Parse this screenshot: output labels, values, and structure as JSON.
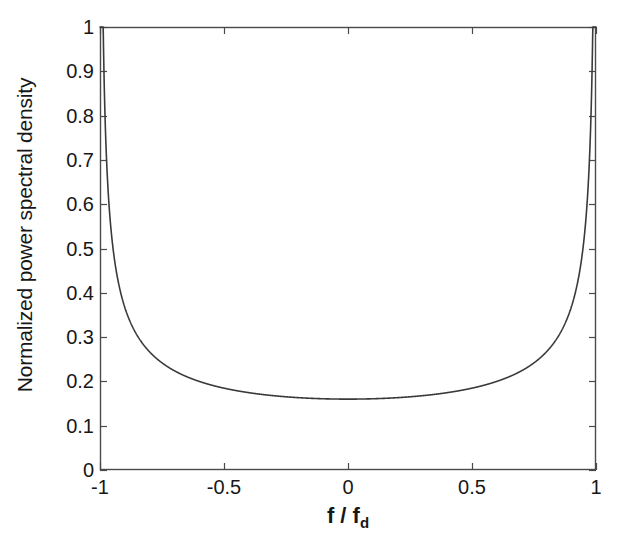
{
  "chart_data": {
    "type": "line",
    "title": "",
    "xlabel": "f / f_d",
    "xlabel_main": "f / f",
    "xlabel_sub": "d",
    "ylabel": "Normalized power spectral density",
    "xlim": [
      -1,
      1
    ],
    "ylim": [
      0,
      1
    ],
    "grid": false,
    "legend": null,
    "line_color": "#3a3a3a",
    "axis_color": "#4a4a4a",
    "background": "#ffffff",
    "xticks": [
      -1,
      -0.5,
      0,
      0.5,
      1
    ],
    "xtick_labels": [
      "-1",
      "-0.5",
      "0",
      "0.5",
      "1"
    ],
    "yticks": [
      0,
      0.1,
      0.2,
      0.3,
      0.4,
      0.5,
      0.6,
      0.7,
      0.8,
      0.9,
      1
    ],
    "ytick_labels": [
      "0",
      "0.1",
      "0.2",
      "0.3",
      "0.4",
      "0.5",
      "0.6",
      "0.7",
      "0.8",
      "0.9",
      "1"
    ],
    "formula_amplitude": 0.16,
    "clip_max": 1.0,
    "min_value": 0.16,
    "min_at_x": 0,
    "series": [
      {
        "name": "Normalized power spectral density",
        "x": [
          -1.0,
          -0.995,
          -0.99,
          -0.987,
          -0.985,
          -0.98,
          -0.975,
          -0.97,
          -0.96,
          -0.95,
          -0.94,
          -0.93,
          -0.92,
          -0.91,
          -0.9,
          -0.88,
          -0.86,
          -0.84,
          -0.82,
          -0.8,
          -0.76,
          -0.72,
          -0.68,
          -0.64,
          -0.6,
          -0.55,
          -0.5,
          -0.45,
          -0.4,
          -0.35,
          -0.3,
          -0.25,
          -0.2,
          -0.15,
          -0.1,
          -0.05,
          0.0,
          0.05,
          0.1,
          0.15,
          0.2,
          0.25,
          0.3,
          0.35,
          0.4,
          0.45,
          0.5,
          0.55,
          0.6,
          0.64,
          0.68,
          0.72,
          0.76,
          0.8,
          0.82,
          0.84,
          0.86,
          0.88,
          0.9,
          0.91,
          0.92,
          0.93,
          0.94,
          0.95,
          0.96,
          0.97,
          0.975,
          0.98,
          0.985,
          0.987,
          0.99,
          0.995,
          1.0
        ],
        "y": [
          1.0,
          1.0,
          1.0,
          1.0,
          0.928,
          0.804,
          0.72,
          0.659,
          0.571,
          0.513,
          0.469,
          0.435,
          0.408,
          0.385,
          0.367,
          0.337,
          0.314,
          0.295,
          0.28,
          0.267,
          0.246,
          0.231,
          0.218,
          0.208,
          0.2,
          0.192,
          0.185,
          0.179,
          0.175,
          0.171,
          0.168,
          0.165,
          0.163,
          0.162,
          0.161,
          0.16,
          0.16,
          0.16,
          0.161,
          0.162,
          0.163,
          0.165,
          0.168,
          0.171,
          0.175,
          0.179,
          0.185,
          0.192,
          0.2,
          0.208,
          0.218,
          0.231,
          0.246,
          0.267,
          0.28,
          0.295,
          0.314,
          0.337,
          0.367,
          0.385,
          0.408,
          0.435,
          0.469,
          0.513,
          0.571,
          0.659,
          0.72,
          0.804,
          0.928,
          1.0,
          1.0,
          1.0,
          1.0
        ]
      }
    ]
  },
  "axes": {
    "plot_left_px": 100,
    "plot_right_px": 596,
    "plot_top_px": 27,
    "plot_bottom_px": 470
  }
}
